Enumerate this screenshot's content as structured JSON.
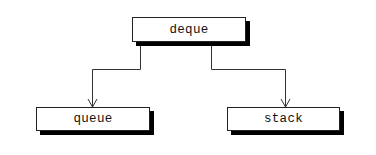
{
  "diagram": {
    "nodes": [
      {
        "id": "deque",
        "label": "deque"
      },
      {
        "id": "queue",
        "label": "queue"
      },
      {
        "id": "stack",
        "label": "stack"
      }
    ],
    "edges": [
      {
        "from": "deque",
        "to": "queue"
      },
      {
        "from": "deque",
        "to": "stack"
      }
    ],
    "colors": {
      "line": "#333333",
      "shadow": "#000000",
      "box_fill": "#ffffff"
    }
  }
}
